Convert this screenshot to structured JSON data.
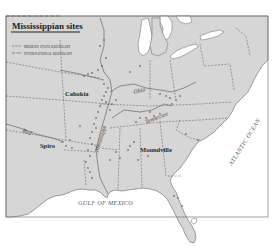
{
  "map": {
    "title": "Mississippian sites",
    "legend": {
      "items": [
        {
          "label": "MODERN STATE BOUNDARY",
          "style": "dashed"
        },
        {
          "label": "INTERNATIONAL BOUNDARY",
          "style": "dash-dot"
        }
      ]
    },
    "sites": [
      {
        "name": "Cahokia"
      },
      {
        "name": "Spiro"
      },
      {
        "name": "Moundville"
      }
    ],
    "rivers": [
      {
        "name": "Red"
      },
      {
        "name": "Ohio"
      },
      {
        "name": "Tennessee"
      },
      {
        "name": "Mississippi"
      }
    ],
    "water_bodies": [
      {
        "name": "GULF OF MEXICO"
      },
      {
        "name": "ATLANTIC OCEAN"
      }
    ],
    "colors": {
      "land": "#d6d6d6",
      "water": "#ffffff",
      "border": "#555555",
      "text": "#2a2a2a"
    }
  }
}
